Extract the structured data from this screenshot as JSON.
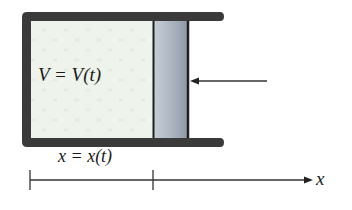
{
  "diagram": {
    "labels": {
      "volume": "V = V(t)",
      "position": "x = x(t)",
      "axis": "x"
    },
    "colors": {
      "wall": "#3a3a3a",
      "gas": "#dfe8dc",
      "piston": "#aab2bf",
      "line": "#333333"
    }
  }
}
